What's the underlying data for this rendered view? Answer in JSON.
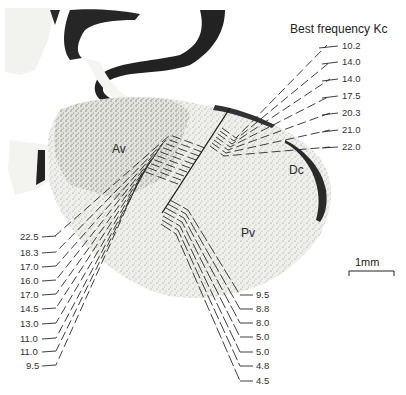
{
  "figure": {
    "title": "Best frequency Kc",
    "regions": {
      "av": "Av",
      "dc": "Dc",
      "pv": "Pv"
    },
    "scale_bar": "1mm",
    "right_track_labels": [
      "10.2",
      "14.0",
      "14.0",
      "17.5",
      "20.3",
      "21.0",
      "22.0"
    ],
    "left_track_labels": [
      "22.5",
      "18.3",
      "17.0",
      "16.0",
      "17.0",
      "14.5",
      "13.0",
      "11.0",
      "11.0",
      "9.5"
    ],
    "bottom_track_labels": [
      "9.5",
      "8.8",
      "8.0",
      "5.0",
      "5.0",
      "4.8",
      "4.5"
    ]
  },
  "colors": {
    "background": "#ffffff",
    "tissue": "#eeeeea",
    "stain_dark": "#1e1e1e",
    "lines": "#2a2a2a"
  }
}
